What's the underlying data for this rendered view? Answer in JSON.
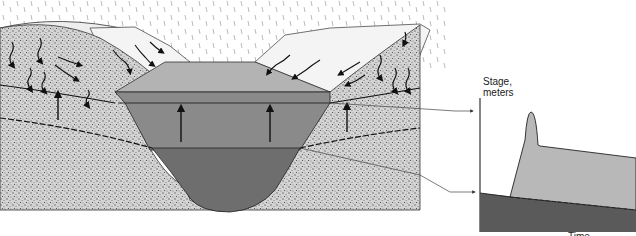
{
  "figure": {
    "type": "stream cross-section with hydrograph",
    "cross_section": {
      "regions": [
        {
          "name": "rain",
          "fill": "#ffffff"
        },
        {
          "name": "valley-hills",
          "fill": "#f2f2f2"
        },
        {
          "name": "storm-flow-water",
          "fill": "#b3b3b3"
        },
        {
          "name": "raised-baseflow-water",
          "fill": "#8a8a8a"
        },
        {
          "name": "baseflow-water",
          "fill": "#6e6e6e"
        },
        {
          "name": "soil-ground",
          "fill": "#cfcfcf"
        }
      ],
      "arrows": {
        "infiltration_down": 10,
        "overland_flow": 8,
        "groundwater_up": 5
      }
    },
    "hydrograph": {
      "ylabel_line1": "Stage,",
      "ylabel_line2": "meters",
      "xlabel_partial": "Time",
      "colors": {
        "baseflow": "#5a5a5a",
        "stormflow": "#b8b8b8",
        "axis": "#333333"
      }
    }
  }
}
